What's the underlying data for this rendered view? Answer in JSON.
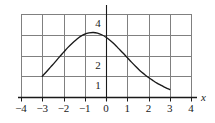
{
  "figure": {
    "width": 215,
    "height": 123,
    "background": "#ffffff",
    "ink_color": "#1a1a1a",
    "grid_color": "#808080",
    "axis_label_x": "x"
  },
  "chart_data": {
    "type": "line",
    "title": "",
    "subtitle": "",
    "xlabel": "x",
    "ylabel": "",
    "grid": true,
    "legend": "none",
    "xlim": [
      -4,
      4
    ],
    "ylim": [
      0,
      4
    ],
    "xticks": [
      -4,
      -3,
      -2,
      -1,
      0,
      1,
      2,
      3,
      4
    ],
    "xtick_labels": [
      "−4",
      "−3",
      "−2",
      "−1",
      "0",
      "1",
      "2",
      "3",
      "4"
    ],
    "yticks": [
      0,
      1,
      2,
      3,
      4
    ],
    "ytick_labels_visible": [
      "4",
      "2",
      "1"
    ],
    "ytick_values_visible": [
      4,
      2,
      1
    ],
    "series": [
      {
        "name": "curve",
        "color": "#1a1a1a",
        "x": [
          -3.0,
          -2.8,
          -2.6,
          -2.4,
          -2.2,
          -2.0,
          -1.8,
          -1.6,
          -1.4,
          -1.2,
          -1.0,
          -0.8,
          -0.6,
          -0.4,
          -0.2,
          0.0,
          0.2,
          0.4,
          0.6,
          0.8,
          1.0,
          1.2,
          1.4,
          1.6,
          1.8,
          2.0,
          2.2,
          2.4,
          2.6,
          2.8,
          3.0
        ],
        "y": [
          1.0,
          1.22,
          1.45,
          1.68,
          1.92,
          2.15,
          2.38,
          2.58,
          2.76,
          2.92,
          3.03,
          3.09,
          3.11,
          3.08,
          3.0,
          2.88,
          2.72,
          2.54,
          2.33,
          2.12,
          1.9,
          1.68,
          1.47,
          1.27,
          1.1,
          0.94,
          0.8,
          0.67,
          0.56,
          0.45,
          0.36
        ]
      }
    ]
  }
}
